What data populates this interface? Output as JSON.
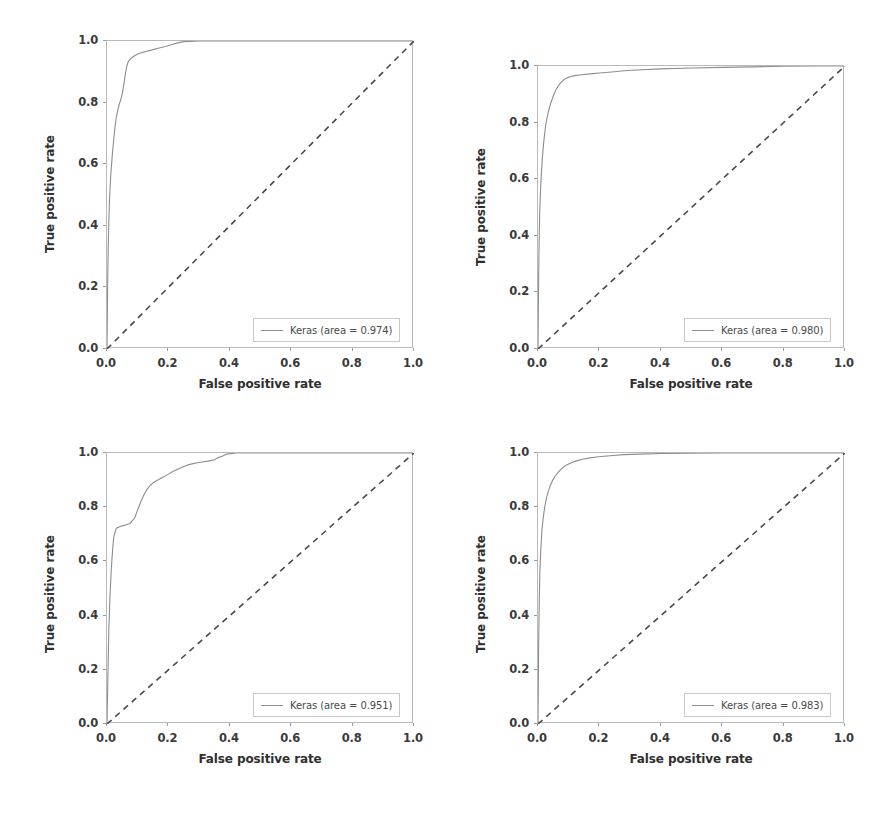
{
  "figure": {
    "width": 891,
    "height": 814,
    "background": "#ffffff",
    "curve_color": "#8d8d8d",
    "diagonal_color": "#4a4a4a",
    "frame_color": "#b9b9b9"
  },
  "axis": {
    "xlabel": "False positive rate",
    "ylabel": "True positive rate",
    "xticks": [
      "0.0",
      "0.2",
      "0.4",
      "0.6",
      "0.8",
      "1.0"
    ],
    "yticks": [
      "0.0",
      "0.2",
      "0.4",
      "0.6",
      "0.8",
      "1.0"
    ]
  },
  "chart_data": [
    {
      "type": "line",
      "title": "",
      "panel": "top-left",
      "xlabel": "False positive rate",
      "ylabel": "True positive rate",
      "xlim": [
        0.0,
        1.0
      ],
      "ylim": [
        0.0,
        1.0
      ],
      "xticks": [
        0.0,
        0.2,
        0.4,
        0.6,
        0.8,
        1.0
      ],
      "yticks": [
        0.0,
        0.2,
        0.4,
        0.6,
        0.8,
        1.0
      ],
      "grid": false,
      "legend_position": "lower right",
      "legend_label": "Keras (area = 0.974)",
      "auc": 0.974,
      "series": [
        {
          "name": "Keras ROC",
          "style": "solid",
          "x": [
            0.0,
            0.002,
            0.004,
            0.006,
            0.008,
            0.01,
            0.012,
            0.015,
            0.018,
            0.022,
            0.026,
            0.03,
            0.035,
            0.04,
            0.045,
            0.05,
            0.055,
            0.06,
            0.065,
            0.07,
            0.08,
            0.09,
            0.1,
            0.115,
            0.13,
            0.15,
            0.17,
            0.19,
            0.21,
            0.23,
            0.25,
            0.3,
            0.4,
            0.5,
            0.6,
            0.7,
            0.8,
            0.9,
            1.0
          ],
          "y": [
            0.0,
            0.2,
            0.33,
            0.42,
            0.48,
            0.52,
            0.56,
            0.6,
            0.64,
            0.68,
            0.72,
            0.75,
            0.775,
            0.795,
            0.81,
            0.83,
            0.86,
            0.895,
            0.92,
            0.935,
            0.945,
            0.952,
            0.958,
            0.963,
            0.967,
            0.972,
            0.977,
            0.982,
            0.988,
            0.994,
            0.998,
            1.0,
            1.0,
            1.0,
            1.0,
            1.0,
            1.0,
            1.0,
            1.0
          ]
        },
        {
          "name": "Chance",
          "style": "dashed",
          "x": [
            0.0,
            1.0
          ],
          "y": [
            0.0,
            1.0
          ]
        }
      ]
    },
    {
      "type": "line",
      "title": "",
      "panel": "top-right",
      "xlabel": "False positive rate",
      "ylabel": "True positive rate",
      "xlim": [
        0.0,
        1.0
      ],
      "ylim": [
        0.0,
        1.0
      ],
      "xticks": [
        0.0,
        0.2,
        0.4,
        0.6,
        0.8,
        1.0
      ],
      "yticks": [
        0.0,
        0.2,
        0.4,
        0.6,
        0.8,
        1.0
      ],
      "grid": false,
      "legend_position": "lower right",
      "legend_label": "Keras (area = 0.980)",
      "auc": 0.98,
      "series": [
        {
          "name": "Keras ROC",
          "style": "solid",
          "x": [
            0.0,
            0.002,
            0.004,
            0.006,
            0.009,
            0.012,
            0.016,
            0.02,
            0.025,
            0.03,
            0.036,
            0.042,
            0.05,
            0.058,
            0.066,
            0.075,
            0.085,
            0.095,
            0.105,
            0.12,
            0.14,
            0.17,
            0.2,
            0.24,
            0.28,
            0.32,
            0.4,
            0.5,
            0.6,
            0.7,
            0.8,
            0.9,
            1.0
          ],
          "y": [
            0.0,
            0.25,
            0.4,
            0.5,
            0.58,
            0.64,
            0.7,
            0.745,
            0.79,
            0.82,
            0.848,
            0.87,
            0.895,
            0.915,
            0.93,
            0.942,
            0.952,
            0.958,
            0.962,
            0.966,
            0.969,
            0.972,
            0.975,
            0.979,
            0.983,
            0.986,
            0.99,
            0.993,
            0.995,
            0.997,
            0.999,
            1.0,
            1.0
          ]
        },
        {
          "name": "Chance",
          "style": "dashed",
          "x": [
            0.0,
            1.0
          ],
          "y": [
            0.0,
            1.0
          ]
        }
      ]
    },
    {
      "type": "line",
      "title": "",
      "panel": "bottom-left",
      "xlabel": "False positive rate",
      "ylabel": "True positive rate",
      "xlim": [
        0.0,
        1.0
      ],
      "ylim": [
        0.0,
        1.0
      ],
      "xticks": [
        0.0,
        0.2,
        0.4,
        0.6,
        0.8,
        1.0
      ],
      "yticks": [
        0.0,
        0.2,
        0.4,
        0.6,
        0.8,
        1.0
      ],
      "grid": false,
      "legend_position": "lower right",
      "legend_label": "Keras (area = 0.951)",
      "auc": 0.951,
      "series": [
        {
          "name": "Keras ROC",
          "style": "solid",
          "x": [
            0.0,
            0.003,
            0.006,
            0.01,
            0.014,
            0.018,
            0.022,
            0.03,
            0.045,
            0.06,
            0.075,
            0.09,
            0.1,
            0.11,
            0.12,
            0.13,
            0.14,
            0.15,
            0.16,
            0.17,
            0.185,
            0.2,
            0.215,
            0.23,
            0.25,
            0.27,
            0.29,
            0.31,
            0.33,
            0.35,
            0.36,
            0.375,
            0.39,
            0.42,
            0.5,
            0.6,
            0.7,
            0.8,
            0.9,
            1.0
          ],
          "y": [
            0.0,
            0.18,
            0.35,
            0.48,
            0.57,
            0.64,
            0.69,
            0.722,
            0.73,
            0.734,
            0.74,
            0.76,
            0.79,
            0.82,
            0.845,
            0.865,
            0.88,
            0.89,
            0.897,
            0.903,
            0.912,
            0.922,
            0.932,
            0.94,
            0.95,
            0.958,
            0.963,
            0.967,
            0.97,
            0.975,
            0.982,
            0.988,
            0.996,
            1.0,
            1.0,
            1.0,
            1.0,
            1.0,
            1.0,
            1.0
          ]
        },
        {
          "name": "Chance",
          "style": "dashed",
          "x": [
            0.0,
            1.0
          ],
          "y": [
            0.0,
            1.0
          ]
        }
      ]
    },
    {
      "type": "line",
      "title": "",
      "panel": "bottom-right",
      "xlabel": "False positive rate",
      "ylabel": "True positive rate",
      "xlim": [
        0.0,
        1.0
      ],
      "ylim": [
        0.0,
        1.0
      ],
      "xticks": [
        0.0,
        0.2,
        0.4,
        0.6,
        0.8,
        1.0
      ],
      "yticks": [
        0.0,
        0.2,
        0.4,
        0.6,
        0.8,
        1.0
      ],
      "grid": false,
      "legend_position": "lower right",
      "legend_label": "Keras (area = 0.983)",
      "auc": 0.983,
      "series": [
        {
          "name": "Keras ROC",
          "style": "solid",
          "x": [
            0.0,
            0.002,
            0.004,
            0.006,
            0.009,
            0.012,
            0.015,
            0.018,
            0.022,
            0.026,
            0.03,
            0.034,
            0.04,
            0.048,
            0.056,
            0.065,
            0.075,
            0.085,
            0.095,
            0.11,
            0.125,
            0.145,
            0.165,
            0.19,
            0.215,
            0.245,
            0.28,
            0.33,
            0.4,
            0.5,
            0.6,
            0.7,
            0.8,
            0.9,
            1.0
          ],
          "y": [
            0.0,
            0.28,
            0.45,
            0.56,
            0.64,
            0.7,
            0.74,
            0.77,
            0.8,
            0.825,
            0.845,
            0.86,
            0.88,
            0.9,
            0.915,
            0.928,
            0.94,
            0.95,
            0.957,
            0.965,
            0.971,
            0.977,
            0.981,
            0.985,
            0.988,
            0.991,
            0.994,
            0.996,
            0.998,
            0.999,
            1.0,
            1.0,
            1.0,
            1.0,
            1.0
          ]
        },
        {
          "name": "Chance",
          "style": "dashed",
          "x": [
            0.0,
            1.0
          ],
          "y": [
            0.0,
            1.0
          ]
        }
      ]
    }
  ],
  "panels": [
    {
      "id": "top-left",
      "legend_label": "Keras (area = 0.974)"
    },
    {
      "id": "top-right",
      "legend_label": "Keras (area = 0.980)"
    },
    {
      "id": "bottom-left",
      "legend_label": "Keras (area = 0.951)"
    },
    {
      "id": "bottom-right",
      "legend_label": "Keras (area = 0.983)"
    }
  ]
}
